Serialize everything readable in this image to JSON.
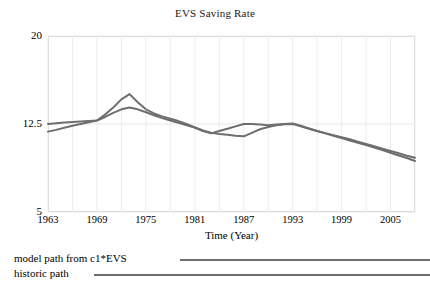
{
  "chart_data": {
    "type": "line",
    "title": "EVS Saving Rate",
    "xlabel": "Time (Year)",
    "ylabel": "",
    "xlim": [
      1963,
      2008
    ],
    "ylim": [
      5,
      20
    ],
    "grid": true,
    "grid_style": "light vertical and horizontal gridlines",
    "legend_position": "below-plot",
    "xticks": [
      "1963",
      "1969",
      "1975",
      "1981",
      "1987",
      "1993",
      "1999",
      "2005"
    ],
    "xtick_values": [
      1963,
      1969,
      1975,
      1981,
      1987,
      1993,
      1999,
      2005
    ],
    "yticks": [
      "20",
      "12.5",
      "5"
    ],
    "ytick_values": [
      20,
      12.5,
      5
    ],
    "x": [
      1963,
      1964,
      1965,
      1966,
      1967,
      1968,
      1969,
      1970,
      1971,
      1972,
      1973,
      1974,
      1975,
      1976,
      1977,
      1978,
      1979,
      1980,
      1981,
      1982,
      1983,
      1984,
      1985,
      1986,
      1987,
      1988,
      1989,
      1990,
      1991,
      1992,
      1993,
      1994,
      1995,
      1996,
      1997,
      1998,
      1999,
      2000,
      2001,
      2002,
      2003,
      2004,
      2005,
      2006,
      2007,
      2008
    ],
    "series": [
      {
        "name": "model path from c1*EVS",
        "color": "#6e6e6e",
        "values": [
          12.5,
          12.56,
          12.62,
          12.68,
          12.72,
          12.76,
          12.8,
          13.1,
          13.45,
          13.75,
          13.9,
          13.75,
          13.5,
          13.25,
          13.0,
          12.8,
          12.6,
          12.4,
          12.2,
          11.95,
          11.75,
          11.65,
          11.58,
          11.5,
          11.45,
          11.75,
          12.05,
          12.25,
          12.4,
          12.48,
          12.5,
          12.3,
          12.1,
          11.9,
          11.72,
          11.55,
          11.38,
          11.2,
          11.0,
          10.8,
          10.6,
          10.4,
          10.2,
          10.0,
          9.8,
          9.62
        ]
      },
      {
        "name": "historic path",
        "color": "#6e6e6e",
        "values": [
          11.85,
          12.0,
          12.18,
          12.35,
          12.5,
          12.65,
          12.8,
          13.3,
          13.9,
          14.6,
          15.05,
          14.35,
          13.75,
          13.4,
          13.15,
          12.95,
          12.75,
          12.5,
          12.2,
          11.9,
          11.7,
          11.9,
          12.1,
          12.3,
          12.5,
          12.5,
          12.45,
          12.4,
          12.45,
          12.5,
          12.55,
          12.35,
          12.12,
          11.9,
          11.7,
          11.5,
          11.3,
          11.1,
          10.9,
          10.7,
          10.5,
          10.28,
          10.05,
          9.82,
          9.6,
          9.35
        ]
      }
    ]
  },
  "legend": {
    "items": [
      {
        "label": "model path from c1*EVS"
      },
      {
        "label": "historic path"
      }
    ]
  }
}
